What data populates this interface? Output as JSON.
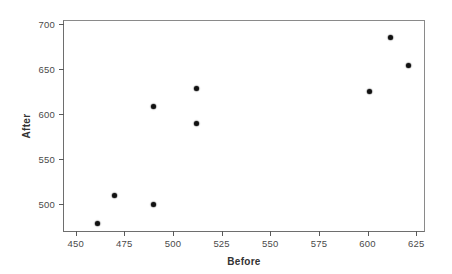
{
  "chart_data": {
    "type": "scatter",
    "title": "",
    "xlabel": "Before",
    "ylabel": "After",
    "xlim": [
      444,
      629
    ],
    "ylim": [
      470,
      703
    ],
    "xticks": [
      450,
      475,
      500,
      525,
      550,
      575,
      600,
      625
    ],
    "yticks": [
      500,
      550,
      600,
      650,
      700
    ],
    "xtick_labels": [
      "450",
      "475",
      "500",
      "525",
      "550",
      "575",
      "600",
      "625"
    ],
    "ytick_labels": [
      "500",
      "550",
      "600",
      "650",
      "700"
    ],
    "grid": false,
    "legend": "none",
    "marker": "filled-circle",
    "marker_color": "#111111",
    "points": [
      {
        "x": 461,
        "y": 478
      },
      {
        "x": 470,
        "y": 509
      },
      {
        "x": 490,
        "y": 499
      },
      {
        "x": 490,
        "y": 608
      },
      {
        "x": 512,
        "y": 628
      },
      {
        "x": 512,
        "y": 589
      },
      {
        "x": 601,
        "y": 625
      },
      {
        "x": 612,
        "y": 685
      },
      {
        "x": 621,
        "y": 654
      }
    ]
  },
  "figure": {
    "background_color": "#ffffff",
    "frame_color": "#6e6e6e"
  }
}
